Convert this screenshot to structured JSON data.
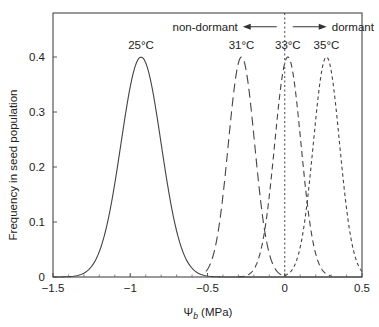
{
  "chart_data": {
    "type": "line",
    "title": "",
    "xlabel": "Ψb (MPa)",
    "xlabel_main": "Ψ",
    "xlabel_sub": "b",
    "xlabel_unit": " (MPa)",
    "ylabel": "Frequency in seed population",
    "xlim": [
      -1.5,
      0.5
    ],
    "ylim": [
      0,
      0.48
    ],
    "xticks": [
      -1.5,
      -1,
      -0.5,
      0,
      0.5
    ],
    "xtick_labels": [
      "−1.5",
      "−1",
      "−0.5",
      "0",
      "0.5"
    ],
    "xminor_step": 0.1,
    "yticks": [
      0,
      0.1,
      0.2,
      0.3,
      0.4
    ],
    "ytick_labels": [
      "0",
      "0.1",
      "0.2",
      "0.3",
      "0.4"
    ],
    "grid": false,
    "legend": "none (curves labeled directly)",
    "series": [
      {
        "name": "25°C",
        "label": "25°C",
        "distribution": "normal",
        "mean": -0.93,
        "sigma": 0.13,
        "peak": 0.4,
        "dash": "solid",
        "x_range": [
          -1.5,
          0.5
        ]
      },
      {
        "name": "31°C",
        "label": "31°C",
        "distribution": "normal",
        "mean": -0.28,
        "sigma": 0.085,
        "peak": 0.4,
        "dash": "long",
        "x_range": [
          -0.51,
          0.0
        ]
      },
      {
        "name": "33°C",
        "label": "33°C",
        "distribution": "normal",
        "mean": 0.02,
        "sigma": 0.085,
        "peak": 0.4,
        "dash": "medium",
        "x_range": [
          -0.3,
          0.3
        ]
      },
      {
        "name": "35°C",
        "label": "35°C",
        "distribution": "normal",
        "mean": 0.27,
        "sigma": 0.085,
        "peak": 0.4,
        "dash": "short",
        "x_range": [
          0.0,
          0.5
        ]
      }
    ],
    "annotations": [
      {
        "text": "non-dormant",
        "arrow": "left",
        "x": -0.05,
        "y": 0.455
      },
      {
        "text": "dormant",
        "arrow": "right",
        "x": 0.05,
        "y": 0.455
      },
      {
        "type": "vline",
        "x": 0,
        "style": "dotted"
      }
    ]
  }
}
